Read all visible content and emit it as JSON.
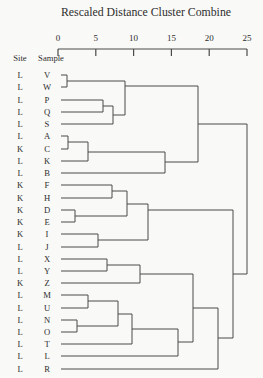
{
  "title": "Rescaled Distance Cluster Combine",
  "headers": {
    "site": "Site",
    "sample": "Sample"
  },
  "axis": {
    "min": 0,
    "max": 25,
    "ticks": [
      0,
      5,
      10,
      15,
      20,
      25
    ],
    "x_for_min": 58,
    "x_for_max": 247,
    "line_y": 49,
    "tick_bottom_y": 56,
    "label_baseline_y": 41
  },
  "rows": [
    {
      "site": "L",
      "sample": "V",
      "y": 75
    },
    {
      "site": "L",
      "sample": "W",
      "y": 87
    },
    {
      "site": "L",
      "sample": "P",
      "y": 100
    },
    {
      "site": "L",
      "sample": "Q",
      "y": 112
    },
    {
      "site": "L",
      "sample": "S",
      "y": 124
    },
    {
      "site": "L",
      "sample": "A",
      "y": 136
    },
    {
      "site": "K",
      "sample": "C",
      "y": 149
    },
    {
      "site": "L",
      "sample": "K",
      "y": 161
    },
    {
      "site": "L",
      "sample": "B",
      "y": 173
    },
    {
      "site": "K",
      "sample": "F",
      "y": 185
    },
    {
      "site": "K",
      "sample": "H",
      "y": 198
    },
    {
      "site": "K",
      "sample": "D",
      "y": 210
    },
    {
      "site": "K",
      "sample": "E",
      "y": 222
    },
    {
      "site": "K",
      "sample": "I",
      "y": 234
    },
    {
      "site": "L",
      "sample": "J",
      "y": 247
    },
    {
      "site": "L",
      "sample": "X",
      "y": 259
    },
    {
      "site": "L",
      "sample": "Y",
      "y": 271
    },
    {
      "site": "K",
      "sample": "Z",
      "y": 283
    },
    {
      "site": "L",
      "sample": "M",
      "y": 295
    },
    {
      "site": "L",
      "sample": "U",
      "y": 308
    },
    {
      "site": "L",
      "sample": "N",
      "y": 320
    },
    {
      "site": "L",
      "sample": "O",
      "y": 332
    },
    {
      "site": "L",
      "sample": "T",
      "y": 344
    },
    {
      "site": "L",
      "sample": "L",
      "y": 356
    },
    {
      "site": "L",
      "sample": "R",
      "y": 369
    }
  ],
  "dendrogram": {
    "line_color": "#4a4a4a",
    "leaf_start_x": 61,
    "segments": [
      [
        61,
        75,
        67,
        75
      ],
      [
        61,
        87,
        67,
        87
      ],
      [
        67,
        75,
        67,
        87
      ],
      [
        67,
        81,
        125,
        81
      ],
      [
        61,
        100,
        103,
        100
      ],
      [
        61,
        112,
        103,
        112
      ],
      [
        103,
        100,
        103,
        112
      ],
      [
        103,
        106,
        113,
        106
      ],
      [
        61,
        124,
        113,
        124
      ],
      [
        113,
        106,
        113,
        124
      ],
      [
        113,
        115,
        125,
        115
      ],
      [
        125,
        81,
        125,
        115
      ],
      [
        125,
        86,
        198,
        86
      ],
      [
        61,
        136,
        68,
        136
      ],
      [
        61,
        149,
        68,
        149
      ],
      [
        68,
        136,
        68,
        149
      ],
      [
        68,
        142,
        88,
        142
      ],
      [
        61,
        161,
        88,
        161
      ],
      [
        88,
        142,
        88,
        161
      ],
      [
        88,
        152,
        165,
        152
      ],
      [
        61,
        173,
        165,
        173
      ],
      [
        165,
        152,
        165,
        173
      ],
      [
        165,
        162,
        198,
        162
      ],
      [
        198,
        86,
        198,
        162
      ],
      [
        198,
        124,
        247,
        124
      ],
      [
        61,
        185,
        112,
        185
      ],
      [
        61,
        198,
        112,
        198
      ],
      [
        112,
        185,
        112,
        198
      ],
      [
        112,
        191,
        127,
        191
      ],
      [
        61,
        210,
        75,
        210
      ],
      [
        61,
        222,
        75,
        222
      ],
      [
        75,
        210,
        75,
        222
      ],
      [
        75,
        216,
        127,
        216
      ],
      [
        127,
        191,
        127,
        216
      ],
      [
        127,
        204,
        148,
        204
      ],
      [
        61,
        234,
        98,
        234
      ],
      [
        61,
        247,
        98,
        247
      ],
      [
        98,
        234,
        98,
        247
      ],
      [
        98,
        240,
        148,
        240
      ],
      [
        148,
        204,
        148,
        240
      ],
      [
        148,
        210,
        233,
        210
      ],
      [
        61,
        259,
        107,
        259
      ],
      [
        61,
        271,
        107,
        271
      ],
      [
        107,
        259,
        107,
        271
      ],
      [
        107,
        265,
        140,
        265
      ],
      [
        61,
        283,
        140,
        283
      ],
      [
        140,
        265,
        140,
        283
      ],
      [
        140,
        274,
        193,
        274
      ],
      [
        61,
        295,
        88,
        295
      ],
      [
        61,
        308,
        88,
        308
      ],
      [
        88,
        295,
        88,
        308
      ],
      [
        88,
        301,
        118,
        301
      ],
      [
        61,
        320,
        77,
        320
      ],
      [
        61,
        332,
        77,
        332
      ],
      [
        77,
        320,
        77,
        332
      ],
      [
        77,
        326,
        118,
        326
      ],
      [
        118,
        301,
        118,
        326
      ],
      [
        118,
        314,
        132,
        314
      ],
      [
        132,
        314,
        132,
        344
      ],
      [
        61,
        344,
        132,
        344
      ],
      [
        132,
        329,
        178,
        329
      ],
      [
        61,
        356,
        178,
        356
      ],
      [
        178,
        329,
        178,
        356
      ],
      [
        178,
        342,
        193,
        342
      ],
      [
        193,
        274,
        193,
        342
      ],
      [
        193,
        308,
        218,
        308
      ],
      [
        61,
        369,
        218,
        369
      ],
      [
        218,
        308,
        218,
        369
      ],
      [
        218,
        338,
        233,
        338
      ],
      [
        233,
        210,
        233,
        338
      ],
      [
        233,
        274,
        247,
        274
      ],
      [
        247,
        124,
        247,
        274
      ]
    ]
  },
  "chart_data": {
    "type": "dendrogram",
    "title": "Rescaled Distance Cluster Combine",
    "xlabel": "Rescaled Distance Cluster Combine",
    "x_range": [
      0,
      25
    ],
    "x_ticks": [
      0,
      5,
      10,
      15,
      20,
      25
    ],
    "orientation": "horizontal, leaves on left",
    "leaf_columns": [
      "Site",
      "Sample"
    ],
    "leaves": [
      {
        "site": "L",
        "sample": "V"
      },
      {
        "site": "L",
        "sample": "W"
      },
      {
        "site": "L",
        "sample": "P"
      },
      {
        "site": "L",
        "sample": "Q"
      },
      {
        "site": "L",
        "sample": "S"
      },
      {
        "site": "L",
        "sample": "A"
      },
      {
        "site": "K",
        "sample": "C"
      },
      {
        "site": "L",
        "sample": "K"
      },
      {
        "site": "L",
        "sample": "B"
      },
      {
        "site": "K",
        "sample": "F"
      },
      {
        "site": "K",
        "sample": "H"
      },
      {
        "site": "K",
        "sample": "D"
      },
      {
        "site": "K",
        "sample": "E"
      },
      {
        "site": "K",
        "sample": "I"
      },
      {
        "site": "L",
        "sample": "J"
      },
      {
        "site": "L",
        "sample": "X"
      },
      {
        "site": "L",
        "sample": "Y"
      },
      {
        "site": "K",
        "sample": "Z"
      },
      {
        "site": "L",
        "sample": "M"
      },
      {
        "site": "L",
        "sample": "U"
      },
      {
        "site": "L",
        "sample": "N"
      },
      {
        "site": "L",
        "sample": "O"
      },
      {
        "site": "L",
        "sample": "T"
      },
      {
        "site": "L",
        "sample": "L"
      },
      {
        "site": "L",
        "sample": "R"
      }
    ],
    "merges": [
      {
        "cluster": [
          "V",
          "W"
        ],
        "distance": 1.2
      },
      {
        "cluster": [
          "P",
          "Q"
        ],
        "distance": 6.0
      },
      {
        "cluster": [
          "P",
          "Q",
          "S"
        ],
        "distance": 7.3
      },
      {
        "cluster": [
          "V",
          "W",
          "P",
          "Q",
          "S"
        ],
        "distance": 8.9
      },
      {
        "cluster": [
          "A",
          "C"
        ],
        "distance": 1.3
      },
      {
        "cluster": [
          "A",
          "C",
          "K"
        ],
        "distance": 4.0
      },
      {
        "cluster": [
          "A",
          "C",
          "K",
          "B"
        ],
        "distance": 14.2
      },
      {
        "cluster": [
          "V",
          "W",
          "P",
          "Q",
          "S",
          "A",
          "C",
          "K",
          "B"
        ],
        "distance": 18.5
      },
      {
        "cluster": [
          "F",
          "H"
        ],
        "distance": 7.1
      },
      {
        "cluster": [
          "D",
          "E"
        ],
        "distance": 2.2
      },
      {
        "cluster": [
          "F",
          "H",
          "D",
          "E"
        ],
        "distance": 9.1
      },
      {
        "cluster": [
          "I",
          "J"
        ],
        "distance": 5.3
      },
      {
        "cluster": [
          "F",
          "H",
          "D",
          "E",
          "I",
          "J"
        ],
        "distance": 11.9
      },
      {
        "cluster": [
          "X",
          "Y"
        ],
        "distance": 6.5
      },
      {
        "cluster": [
          "X",
          "Y",
          "Z"
        ],
        "distance": 10.8
      },
      {
        "cluster": [
          "M",
          "U"
        ],
        "distance": 4.0
      },
      {
        "cluster": [
          "N",
          "O"
        ],
        "distance": 2.5
      },
      {
        "cluster": [
          "M",
          "U",
          "N",
          "O"
        ],
        "distance": 7.9
      },
      {
        "cluster": [
          "M",
          "U",
          "N",
          "O",
          "T"
        ],
        "distance": 9.8
      },
      {
        "cluster": [
          "M",
          "U",
          "N",
          "O",
          "T",
          "L"
        ],
        "distance": 15.9
      },
      {
        "cluster": [
          "X",
          "Y",
          "Z",
          "M",
          "U",
          "N",
          "O",
          "T",
          "L"
        ],
        "distance": 17.9
      },
      {
        "cluster": [
          "X",
          "Y",
          "Z",
          "M",
          "U",
          "N",
          "O",
          "T",
          "L",
          "R"
        ],
        "distance": 21.2
      },
      {
        "cluster": [
          "F",
          "H",
          "D",
          "E",
          "I",
          "J",
          "X",
          "Y",
          "Z",
          "M",
          "U",
          "N",
          "O",
          "T",
          "L",
          "R"
        ],
        "distance": 23.1
      },
      {
        "cluster": [
          "all 25 samples"
        ],
        "distance": 25.0
      }
    ]
  }
}
